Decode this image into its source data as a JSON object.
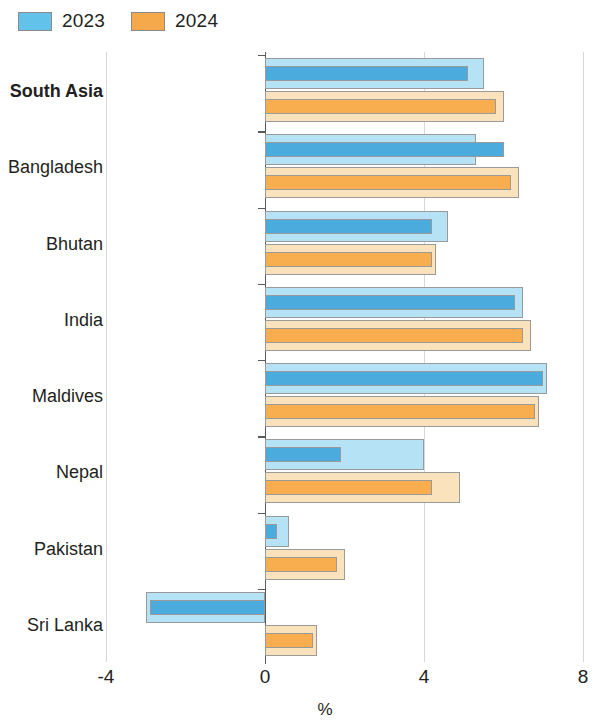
{
  "legend": {
    "items": [
      {
        "label": "2023",
        "color": "#63c2ea",
        "key": "y2023"
      },
      {
        "label": "2024",
        "color": "#f6a94b",
        "key": "y2024"
      }
    ]
  },
  "axis": {
    "unit": "%",
    "ticks": [
      "-4",
      "0",
      "4",
      "8"
    ],
    "tick_values": [
      -4,
      0,
      4,
      8
    ]
  },
  "categories": [
    "South Asia",
    "Bangladesh",
    "Bhutan",
    "India",
    "Maldives",
    "Nepal",
    "Pakistan",
    "Sri Lanka"
  ],
  "chart_data": {
    "type": "bar",
    "orientation": "horizontal",
    "title": "",
    "subtitle": "",
    "xlabel": "%",
    "ylabel": "",
    "xlim": [
      -4,
      8
    ],
    "xticks": [
      -4,
      0,
      4,
      8
    ],
    "grid": true,
    "legend_position": "top-left",
    "categories": [
      "South Asia",
      "Bangladesh",
      "Bhutan",
      "India",
      "Maldives",
      "Nepal",
      "Pakistan",
      "Sri Lanka"
    ],
    "series": [
      {
        "name": "2023",
        "color": "#63c2ea",
        "values": [
          5.5,
          5.3,
          4.6,
          6.5,
          7.1,
          4.0,
          0.6,
          -3.0
        ],
        "inner_values": [
          5.1,
          6.0,
          4.2,
          6.3,
          7.0,
          1.9,
          0.3,
          -2.9
        ]
      },
      {
        "name": "2024",
        "color": "#f6a94b",
        "values": [
          6.0,
          6.4,
          4.3,
          6.7,
          6.9,
          4.9,
          2.0,
          1.3
        ],
        "inner_values": [
          5.8,
          6.2,
          4.2,
          6.5,
          6.8,
          4.2,
          1.8,
          1.2
        ]
      }
    ]
  },
  "colors": {
    "blue_pale": "#b6e2f6",
    "blue_solid": "#4aabdc",
    "orange_pale": "#fae2bd",
    "orange_solid": "#f8ae4e",
    "axis": "#5a5a5a",
    "grid": "#d7d7d7",
    "text": "#231f20"
  }
}
